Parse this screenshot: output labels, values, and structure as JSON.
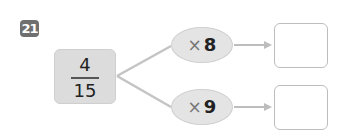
{
  "problem": {
    "number": "21",
    "fraction": {
      "numerator": "4",
      "denominator": "15"
    },
    "operations": [
      {
        "symbol": "×",
        "value": "8",
        "answer": ""
      },
      {
        "symbol": "×",
        "value": "9",
        "answer": ""
      }
    ]
  },
  "colors": {
    "badge": "#6f6f6f",
    "fraction_box": "#dcdcdc",
    "ellipse": "#e4e4e4",
    "lines": "#bdbdbd"
  }
}
